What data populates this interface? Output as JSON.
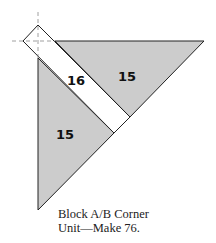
{
  "diagram": {
    "pieces": [
      {
        "id": "top-triangle",
        "label": "15",
        "fill": "#cccccc"
      },
      {
        "id": "strip",
        "label": "16",
        "fill": "#ffffff"
      },
      {
        "id": "left-triangle",
        "label": "15",
        "fill": "#cccccc"
      }
    ],
    "caption": {
      "line1": "Block A/B Corner",
      "line2": "Unit—Make 76."
    }
  }
}
